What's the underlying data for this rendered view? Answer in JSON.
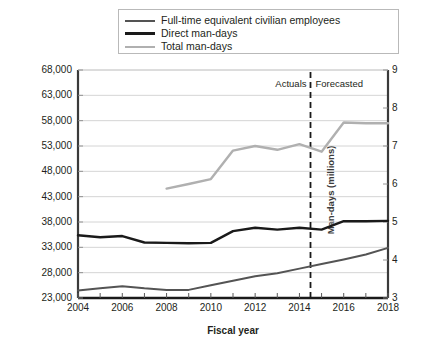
{
  "legend": {
    "items": [
      {
        "label": "Full-time equivalent civilian employees",
        "color": "#545454"
      },
      {
        "label": "Direct man-days",
        "color": "#1a1a1a"
      },
      {
        "label": "Total man-days",
        "color": "#b0b0b0"
      }
    ]
  },
  "annotations": {
    "actuals": "Actuals",
    "forecasted": "Forecasted",
    "divider_year": 2014.5
  },
  "chart_data": {
    "type": "line",
    "title": "",
    "xlabel": "Fiscal year",
    "ylabel": "Full-time equivalent civilian employees",
    "ylabel_right": "Man-days (millions)",
    "xlim": [
      2004,
      2018
    ],
    "ylim": [
      23000,
      68000
    ],
    "ylim_right": [
      3,
      9
    ],
    "grid": true,
    "legend_position": "top",
    "x": [
      2004,
      2005,
      2006,
      2007,
      2008,
      2009,
      2010,
      2011,
      2012,
      2013,
      2014,
      2015,
      2016,
      2017,
      2018
    ],
    "xticks": [
      2004,
      2006,
      2008,
      2010,
      2012,
      2014,
      2016,
      2018
    ],
    "xticklabels": [
      "2004",
      "2006",
      "2008",
      "2010",
      "2012",
      "2014",
      "2016",
      "2018"
    ],
    "yticks": [
      23000,
      28000,
      33000,
      38000,
      43000,
      48000,
      53000,
      58000,
      63000,
      68000
    ],
    "yticklabels": [
      "23,000",
      "28,000",
      "33,000",
      "38,000",
      "43,000",
      "48,000",
      "53,000",
      "58,000",
      "63,000",
      "68,000"
    ],
    "yticks_right": [
      3,
      4,
      5,
      6,
      7,
      8,
      9
    ],
    "yticklabels_right": [
      "3",
      "4",
      "5",
      "6",
      "7",
      "8",
      "9"
    ],
    "series": [
      {
        "name": "Full-time equivalent civilian employees",
        "axis": "left",
        "color": "#545454",
        "width": 2.0,
        "values": [
          24500,
          24900,
          25300,
          24900,
          24600,
          24600,
          25500,
          26400,
          27300,
          27900,
          28800,
          29700,
          30600,
          31600,
          32900
        ]
      },
      {
        "name": "Direct man-days",
        "axis": "right",
        "color": "#1a1a1a",
        "width": 2.4,
        "values": [
          4.65,
          4.6,
          4.63,
          4.46,
          4.45,
          4.44,
          4.45,
          4.76,
          4.85,
          4.8,
          4.85,
          4.8,
          5.02,
          5.02,
          5.03
        ]
      },
      {
        "name": "Total man-days",
        "axis": "right",
        "color": "#b0b0b0",
        "width": 2.4,
        "start_index": 4,
        "values": [
          null,
          null,
          null,
          null,
          5.88,
          6.0,
          6.13,
          6.88,
          7.0,
          6.9,
          7.05,
          6.85,
          7.62,
          7.6,
          7.6
        ]
      }
    ]
  }
}
